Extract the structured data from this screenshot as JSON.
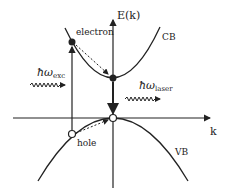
{
  "diagram": {
    "axes": {
      "y_label": "E(k)",
      "x_label": "k"
    },
    "bands": {
      "conduction": "CB",
      "valence": "VB"
    },
    "carriers": {
      "electron": "electron",
      "hole": "hole"
    },
    "photons": {
      "excitation": {
        "symbol": "ħω",
        "subscript": "exc"
      },
      "laser": {
        "symbol": "ħω",
        "subscript": "laser"
      }
    },
    "colors": {
      "line": "#222222",
      "background": "#ffffff"
    }
  }
}
